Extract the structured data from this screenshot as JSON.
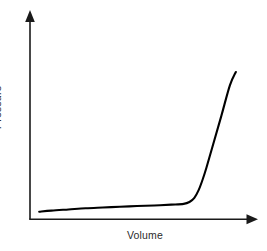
{
  "chart_data": {
    "type": "line",
    "title": "",
    "subtitle": "",
    "xlabel": "Volume",
    "ylabel": "Pressure",
    "legend": [],
    "annotations": [],
    "grid": false,
    "legend_position": "none",
    "axis_style": "arrow-headed, no tick marks, no numeric tick labels",
    "xlim": [
      0,
      1
    ],
    "ylim": [
      0,
      1
    ],
    "xticks": [],
    "yticks": [],
    "series": [
      {
        "name": "Pressure vs Volume",
        "color": "#000000",
        "x": [
          0.043,
          0.1,
          0.18,
          0.26,
          0.34,
          0.42,
          0.5,
          0.58,
          0.66,
          0.718,
          0.745,
          0.768,
          0.788,
          0.806,
          0.824,
          0.856,
          0.894,
          0.934,
          0.962
        ],
        "y": [
          0.039,
          0.045,
          0.051,
          0.057,
          0.061,
          0.065,
          0.069,
          0.072,
          0.076,
          0.08,
          0.09,
          0.112,
          0.152,
          0.205,
          0.268,
          0.392,
          0.54,
          0.7,
          0.77
        ]
      }
    ]
  },
  "figure": {
    "background_color": "#ffffff",
    "axis_color": "#1a1a1a",
    "label_color": "#2b2b2b",
    "curve_color": "#000000"
  },
  "labels": {
    "y_axis": "Pressure",
    "x_axis": "Volume"
  },
  "icons": {
    "y_axis_arrow": "arrow-up-icon",
    "x_axis_arrow": "arrow-right-icon"
  }
}
